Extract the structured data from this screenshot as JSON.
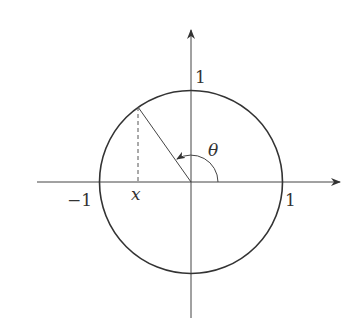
{
  "diagram": {
    "labels": {
      "y_axis_one": "1",
      "x_axis_one": "1",
      "x_axis_neg_one": "−1",
      "x_point": "x",
      "theta": "θ"
    },
    "colors": {
      "stroke": "#333333",
      "background": "#ffffff"
    }
  }
}
